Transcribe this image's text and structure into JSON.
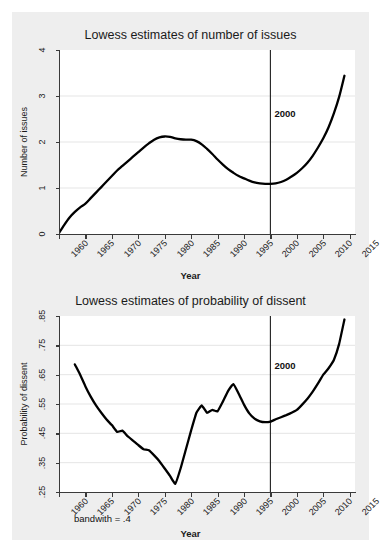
{
  "figure": {
    "note": "bandwith = .4",
    "background_color": "#eeeeee",
    "plot_background_color": "#ffffff",
    "line_color": "#000000",
    "axis_color": "#3a3a3a"
  },
  "chart_data": [
    {
      "type": "line",
      "title": "Lowess estimates of number of issues",
      "xlabel": "Year",
      "ylabel": "Number of issues",
      "xlim": [
        1960,
        2016
      ],
      "ylim": [
        0,
        4
      ],
      "yticks": [
        "0",
        "1",
        "2",
        "3",
        "4"
      ],
      "ytick_values": [
        0,
        1,
        2,
        3,
        4
      ],
      "xticks": [
        "1960",
        "1965",
        "1970",
        "1975",
        "1980",
        "1985",
        "1990",
        "1995",
        "2000",
        "2005",
        "2010",
        "2015"
      ],
      "xtick_values": [
        1960,
        1965,
        1970,
        1975,
        1980,
        1985,
        1990,
        1995,
        2000,
        2005,
        2010,
        2015
      ],
      "grid": "horizontal",
      "legend": "none",
      "annotations": [
        {
          "text": "2000",
          "x": 2000,
          "y": 2.6,
          "type": "vline-label"
        }
      ],
      "vlines": [
        {
          "x": 2000,
          "label": "2000"
        }
      ],
      "series": [
        {
          "name": "Number of issues (lowess)",
          "x": [
            1960,
            1961,
            1962,
            1963,
            1964,
            1965,
            1966,
            1967,
            1968,
            1969,
            1970,
            1971,
            1972,
            1973,
            1974,
            1975,
            1976,
            1977,
            1978,
            1979,
            1980,
            1981,
            1982,
            1983,
            1984,
            1985,
            1986,
            1987,
            1988,
            1989,
            1990,
            1991,
            1992,
            1993,
            1994,
            1995,
            1996,
            1997,
            1998,
            1999,
            2000,
            2001,
            2002,
            2003,
            2004,
            2005,
            2006,
            2007,
            2008,
            2009,
            2010,
            2011,
            2012,
            2013,
            2014
          ],
          "y": [
            0.02,
            0.2,
            0.36,
            0.48,
            0.58,
            0.66,
            0.78,
            0.9,
            1.02,
            1.14,
            1.26,
            1.38,
            1.48,
            1.58,
            1.68,
            1.78,
            1.88,
            1.97,
            2.05,
            2.1,
            2.12,
            2.11,
            2.08,
            2.06,
            2.05,
            2.05,
            2.02,
            1.95,
            1.85,
            1.74,
            1.62,
            1.51,
            1.41,
            1.33,
            1.26,
            1.21,
            1.16,
            1.12,
            1.1,
            1.09,
            1.09,
            1.1,
            1.13,
            1.18,
            1.25,
            1.33,
            1.43,
            1.55,
            1.7,
            1.88,
            2.08,
            2.32,
            2.62,
            2.98,
            3.44
          ]
        }
      ]
    },
    {
      "type": "line",
      "title": "Lowess estimates of probability of dissent",
      "xlabel": "Year",
      "ylabel": "Probability of dissent",
      "xlim": [
        1960,
        2016
      ],
      "ylim": [
        0.25,
        0.85
      ],
      "yticks": [
        ".25",
        ".35",
        ".45",
        ".55",
        ".65",
        ".75",
        ".85"
      ],
      "ytick_values": [
        0.25,
        0.35,
        0.45,
        0.55,
        0.65,
        0.75,
        0.85
      ],
      "xticks": [
        "1960",
        "1965",
        "1970",
        "1975",
        "1980",
        "1985",
        "1990",
        "1995",
        "2000",
        "2005",
        "2010",
        "2015"
      ],
      "xtick_values": [
        1960,
        1965,
        1970,
        1975,
        1980,
        1985,
        1990,
        1995,
        2000,
        2005,
        2010,
        2015
      ],
      "grid": "horizontal",
      "legend": "none",
      "annotations": [
        {
          "text": "2000",
          "x": 2000,
          "y": 0.68,
          "type": "vline-label"
        }
      ],
      "vlines": [
        {
          "x": 2000,
          "label": "2000"
        }
      ],
      "series": [
        {
          "name": "Probability of dissent (lowess)",
          "x": [
            1963,
            1964,
            1965,
            1966,
            1967,
            1968,
            1969,
            1970,
            1971,
            1972,
            1973,
            1974,
            1975,
            1976,
            1977,
            1978,
            1979,
            1980,
            1981,
            1982,
            1983,
            1984,
            1985,
            1986,
            1987,
            1988,
            1989,
            1990,
            1991,
            1992,
            1993,
            1994,
            1995,
            1996,
            1997,
            1998,
            1999,
            2000,
            2001,
            2002,
            2003,
            2004,
            2005,
            2006,
            2007,
            2008,
            2009,
            2010,
            2011,
            2012,
            2013,
            2014
          ],
          "y": [
            0.685,
            0.65,
            0.61,
            0.575,
            0.545,
            0.52,
            0.497,
            0.478,
            0.455,
            0.459,
            0.44,
            0.425,
            0.41,
            0.396,
            0.392,
            0.375,
            0.355,
            0.33,
            0.305,
            0.278,
            0.33,
            0.395,
            0.46,
            0.52,
            0.545,
            0.52,
            0.53,
            0.525,
            0.558,
            0.595,
            0.618,
            0.585,
            0.548,
            0.518,
            0.5,
            0.491,
            0.488,
            0.49,
            0.498,
            0.505,
            0.512,
            0.52,
            0.53,
            0.548,
            0.568,
            0.592,
            0.62,
            0.65,
            0.672,
            0.7,
            0.755,
            0.838
          ]
        }
      ]
    }
  ]
}
